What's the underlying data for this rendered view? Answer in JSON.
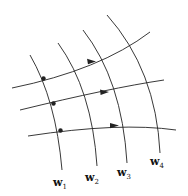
{
  "diagram": {
    "type": "curvilinear grid of flow lines",
    "vertical_curves": [
      {
        "id": "w1",
        "label": "w",
        "sub": "1"
      },
      {
        "id": "w2",
        "label": "w",
        "sub": "2"
      },
      {
        "id": "w3",
        "label": "w",
        "sub": "3"
      },
      {
        "id": "w4",
        "label": "w",
        "sub": "4"
      }
    ],
    "horizontal_curves": 3,
    "arrows": 3,
    "points": 3,
    "colors": {
      "stroke": "#222222",
      "background": "#ffffff"
    }
  }
}
